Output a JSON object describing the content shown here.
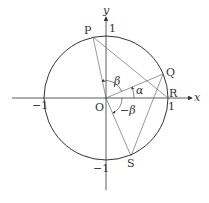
{
  "diagram": {
    "type": "unit-circle-geometry",
    "axes": {
      "x_label": "x",
      "y_label": "y"
    },
    "tick_labels": {
      "x_pos": "1",
      "x_neg": "−1",
      "y_pos": "1",
      "y_neg": "−1"
    },
    "points": {
      "origin": "O",
      "P": "P",
      "Q": "Q",
      "R": "R",
      "S": "S"
    },
    "angles": {
      "alpha": "α",
      "beta": "β",
      "neg_beta": "−β"
    },
    "colors": {
      "stroke": "#333333",
      "thin_line": "#555555",
      "background": "#ffffff"
    }
  }
}
